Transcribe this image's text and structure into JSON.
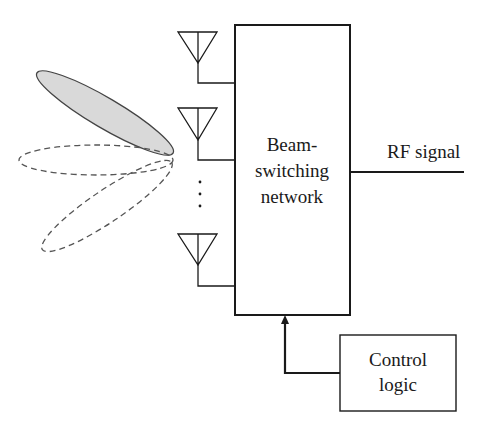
{
  "diagram": {
    "type": "block-diagram",
    "title": "",
    "main_block": {
      "lines": [
        "Beam-",
        "switching",
        "network"
      ]
    },
    "control_block": {
      "lines": [
        "Control",
        "logic"
      ]
    },
    "output_label": "RF signal",
    "antennas": [
      {
        "id": "antenna-1"
      },
      {
        "id": "antenna-2"
      },
      {
        "id": "antenna-n"
      }
    ],
    "ellipsis": "⋮",
    "beams": [
      {
        "id": "beam-active",
        "style": "shaded",
        "fill": "#d9d9d9"
      },
      {
        "id": "beam-horizontal",
        "style": "dashed"
      },
      {
        "id": "beam-lower",
        "style": "dashed"
      }
    ],
    "colors": {
      "stroke": "#1a1a1a",
      "beam_fill": "#d9d9d9",
      "dashed_stroke": "#555555"
    }
  }
}
